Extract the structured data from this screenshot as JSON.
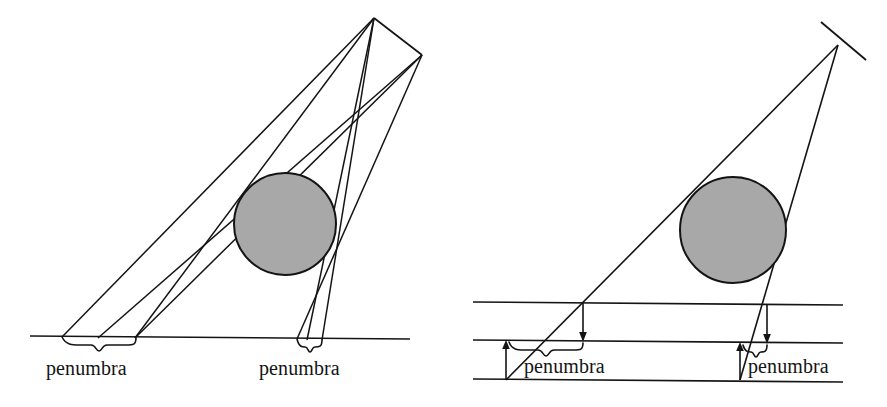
{
  "figure": {
    "background_color": "#ffffff",
    "stroke_color": "#141414",
    "sphere_fill_color": "#a8a8a8",
    "width": 887,
    "height": 407
  },
  "panels": [
    {
      "id": "left-panel",
      "name": "extended-source-panel",
      "light_source": {
        "type": "extended-linear-source",
        "segment": [
          [
            374,
            18
          ],
          [
            422,
            55
          ]
        ]
      },
      "occluder": {
        "type": "circle",
        "center": [
          285,
          224
        ],
        "radius": 51,
        "fill": "#a8a8a8"
      },
      "ground_line": {
        "from": [
          30,
          336
        ],
        "to": [
          410,
          339
        ]
      },
      "penumbra_regions": [
        {
          "label": "penumbra",
          "brace_from": 62,
          "brace_to": 135,
          "brace_y": 338
        },
        {
          "label": "penumbra",
          "brace_from": 297,
          "brace_to": 323,
          "brace_y": 340
        }
      ]
    },
    {
      "id": "right-panel",
      "name": "point-source-panel",
      "light_source": {
        "type": "point-source",
        "point": [
          838,
          45
        ],
        "tick_segment": [
          [
            821,
            22
          ],
          [
            866,
            60
          ]
        ]
      },
      "occluder": {
        "type": "circle",
        "center": [
          733,
          230
        ],
        "radius": 53,
        "fill": "#a8a8a8"
      },
      "ground_lines": [
        {
          "name": "upper-plane",
          "from": [
            473,
            302
          ],
          "to": [
            843,
            305
          ]
        },
        {
          "name": "middle-plane",
          "from": [
            473,
            340
          ],
          "to": [
            843,
            343
          ]
        },
        {
          "name": "lower-plane",
          "from": [
            473,
            379
          ],
          "to": [
            843,
            382
          ]
        }
      ],
      "penumbra_regions": [
        {
          "label": "penumbra",
          "brace_from": 510,
          "brace_to": 582,
          "brace_y": 345
        },
        {
          "label": "penumbra",
          "brace_from": 743,
          "brace_to": 766,
          "brace_y": 347
        }
      ],
      "arrows": [
        {
          "name": "up-arrow-left",
          "from": [
            506,
            379
          ],
          "to": [
            506,
            341
          ],
          "direction": "up"
        },
        {
          "name": "down-arrow-left",
          "from": [
            583,
            303
          ],
          "to": [
            583,
            341
          ],
          "direction": "down"
        },
        {
          "name": "up-arrow-right",
          "from": [
            740,
            379
          ],
          "to": [
            740,
            343
          ],
          "direction": "up"
        },
        {
          "name": "down-arrow-right",
          "from": [
            767,
            305
          ],
          "to": [
            767,
            343
          ],
          "direction": "down"
        }
      ]
    }
  ],
  "labels": {
    "left_penumbra_a": "penumbra",
    "left_penumbra_b": "penumbra",
    "right_penumbra_a": "penumbra",
    "right_penumbra_b": "penumbra"
  }
}
